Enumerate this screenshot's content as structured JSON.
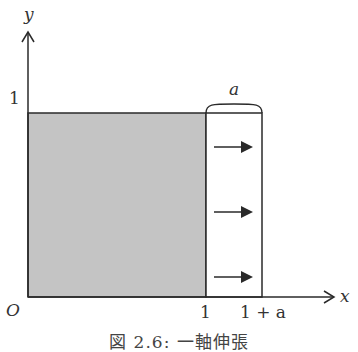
{
  "figure": {
    "caption": "図 2.6: 一軸伸張",
    "axes": {
      "x_label": "x",
      "y_label": "y",
      "origin_label": "O"
    },
    "ticks": {
      "y_one": "1",
      "x_one": "1",
      "x_one_plus_a": "1 + a"
    },
    "extension_label": "a",
    "arrows": [
      {
        "name": "stretch-arrow-top"
      },
      {
        "name": "stretch-arrow-middle"
      },
      {
        "name": "stretch-arrow-bottom"
      }
    ],
    "colors": {
      "shaded_region": "#c4c4c4",
      "lines": "#2a2a2a",
      "background": "#ffffff"
    }
  }
}
